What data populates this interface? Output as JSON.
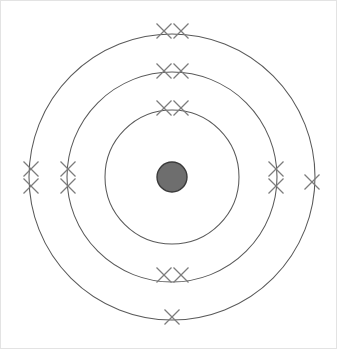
{
  "diagram": {
    "type": "bohr-atomic-shell-model",
    "title": "",
    "center": {
      "x": 172,
      "y": 177
    },
    "nucleus": {
      "label": "nucleus",
      "radius": 15,
      "fill_color": "#6e6e6e",
      "stroke_color": "#3a3a3a"
    },
    "electron": {
      "glyph": "x",
      "symbol_name": "electron-cross-mark",
      "color": "#7c7c7c",
      "arm_half_length": 7.5
    },
    "shell_ring_color": "#5a5a5a",
    "background_color": "#ffffff",
    "border_color": "#e3e3e3",
    "electron_configuration": "2,8,6",
    "total_electrons": 16,
    "shells": [
      {
        "index": 1,
        "name": "shell-1-inner",
        "radius": 67,
        "electron_count": 2,
        "electrons": [
          {
            "name": "electron-s1-top-left",
            "x": 164,
            "y": 108
          },
          {
            "name": "electron-s1-top-right",
            "x": 181,
            "y": 108
          }
        ]
      },
      {
        "index": 2,
        "name": "shell-2-middle",
        "radius": 105,
        "electron_count": 8,
        "electrons": [
          {
            "name": "electron-s2-top-left",
            "x": 164,
            "y": 71
          },
          {
            "name": "electron-s2-top-right",
            "x": 181,
            "y": 71
          },
          {
            "name": "electron-s2-left-upper",
            "x": 68,
            "y": 169
          },
          {
            "name": "electron-s2-left-lower",
            "x": 68,
            "y": 186
          },
          {
            "name": "electron-s2-right-upper",
            "x": 276,
            "y": 169
          },
          {
            "name": "electron-s2-right-lower",
            "x": 276,
            "y": 186
          },
          {
            "name": "electron-s2-bottom-left",
            "x": 164,
            "y": 275
          },
          {
            "name": "electron-s2-bottom-right",
            "x": 181,
            "y": 275
          }
        ]
      },
      {
        "index": 3,
        "name": "shell-3-outer",
        "radius": 143,
        "electron_count": 6,
        "electrons": [
          {
            "name": "electron-s3-top-left",
            "x": 164,
            "y": 31
          },
          {
            "name": "electron-s3-top-right",
            "x": 181,
            "y": 31
          },
          {
            "name": "electron-s3-left-upper",
            "x": 31,
            "y": 169
          },
          {
            "name": "electron-s3-left-lower",
            "x": 31,
            "y": 186
          },
          {
            "name": "electron-s3-right",
            "x": 312,
            "y": 182
          },
          {
            "name": "electron-s3-bottom",
            "x": 172,
            "y": 317
          }
        ]
      }
    ]
  }
}
